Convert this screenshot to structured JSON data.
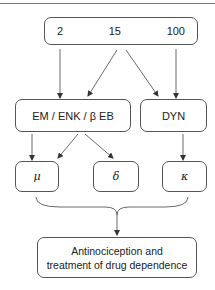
{
  "diagram": {
    "doses": [
      "2",
      "15",
      "100"
    ],
    "peptides": {
      "left_label": "EM / ENK / β EB",
      "right_label": "DYN"
    },
    "receptors": {
      "mu": "μ",
      "delta": "δ",
      "kappa": "κ"
    },
    "outcome": {
      "line1": "Antinociception and",
      "line2": "treatment of drug dependence"
    },
    "colors": {
      "stroke": "#555555",
      "text": "#222222",
      "background": "#ffffff"
    }
  }
}
